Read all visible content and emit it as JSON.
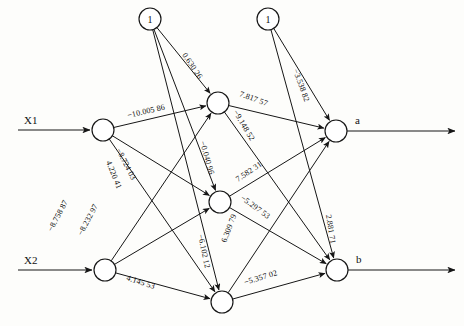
{
  "figure": {
    "type": "neural-network-diagram",
    "canvas": {
      "width": 464,
      "height": 326
    },
    "ink_color": "#161616",
    "background_color": "#fdfdfb"
  },
  "inputs": [
    {
      "id": "x1",
      "label": "X1",
      "node_x": 103,
      "node_y": 130,
      "arrow_from_x": 18,
      "label_x": 24,
      "label_y": 124
    },
    {
      "id": "x2",
      "label": "X2",
      "node_x": 105,
      "node_y": 270,
      "arrow_from_x": 18,
      "label_x": 24,
      "label_y": 264
    }
  ],
  "biases": [
    {
      "id": "bias_hidden",
      "label": "1",
      "node_x": 150,
      "node_y": 19,
      "r": 11
    },
    {
      "id": "bias_output",
      "label": "1",
      "node_x": 268,
      "node_y": 19,
      "r": 11
    }
  ],
  "hidden_nodes": [
    {
      "id": "h1",
      "node_x": 218,
      "node_y": 103,
      "r": 11
    },
    {
      "id": "h2",
      "node_x": 220,
      "node_y": 202,
      "r": 11
    },
    {
      "id": "h3",
      "node_x": 222,
      "node_y": 302,
      "r": 11
    }
  ],
  "output_nodes": [
    {
      "id": "out_a",
      "label": "a",
      "node_x": 336,
      "node_y": 131,
      "r": 11,
      "arrow_to_x": 455,
      "label_x": 355,
      "label_y": 124
    },
    {
      "id": "out_b",
      "label": "b",
      "node_x": 337,
      "node_y": 270,
      "r": 11,
      "arrow_to_x": 455,
      "label_x": 356,
      "label_y": 263
    }
  ],
  "weights": [
    {
      "id": "w_x1_h1",
      "from": "x1",
      "to": "h1",
      "value": "−10.005 86",
      "lx": 128,
      "ly": 118,
      "angle": -13
    },
    {
      "id": "w_x1_h2",
      "from": "x1",
      "to": "h2",
      "value": "−8.724 03",
      "lx": 116,
      "ly": 150,
      "angle": 63
    },
    {
      "id": "w_x1_h3",
      "from": "x1",
      "to": "h3",
      "value": "4.220 41",
      "lx": 106,
      "ly": 162,
      "angle": 68
    },
    {
      "id": "w_x2_h1",
      "from": "x2",
      "to": "h1",
      "value": "−8.758 87",
      "lx": 52,
      "ly": 232,
      "angle": -62
    },
    {
      "id": "w_x2_h2",
      "from": "x2",
      "to": "h2",
      "value": "−8.232 97",
      "lx": 82,
      "ly": 236,
      "angle": -62
    },
    {
      "id": "w_x2_h3",
      "from": "x2",
      "to": "h3",
      "value": "4.145 53",
      "lx": 126,
      "ly": 280,
      "angle": 18
    },
    {
      "id": "w_b_h1",
      "from": "bias_hidden",
      "to": "h1",
      "value": "0.630 26",
      "lx": 182,
      "ly": 55,
      "angle": 56
    },
    {
      "id": "w_b_h2",
      "from": "bias_hidden",
      "to": "h2",
      "value": "−0.040 96",
      "lx": 200,
      "ly": 142,
      "angle": 74
    },
    {
      "id": "w_b_h3",
      "from": "bias_hidden",
      "to": "h3",
      "value": "−6.102 12",
      "lx": 198,
      "ly": 235,
      "angle": 78
    },
    {
      "id": "w_h1_a",
      "from": "h1",
      "to": "out_a",
      "value": "7.817 57",
      "lx": 239,
      "ly": 96,
      "angle": 20
    },
    {
      "id": "w_h1_b",
      "from": "h1",
      "to": "out_b",
      "value": "−9.148 52",
      "lx": 233,
      "ly": 112,
      "angle": 59
    },
    {
      "id": "w_h2_a",
      "from": "h2",
      "to": "out_a",
      "value": "7.582 31",
      "lx": 238,
      "ly": 182,
      "angle": -34
    },
    {
      "id": "w_h2_b",
      "from": "h2",
      "to": "out_b",
      "value": "−5.297 53",
      "lx": 240,
      "ly": 199,
      "angle": 36
    },
    {
      "id": "w_h3_a",
      "from": "h3",
      "to": "out_a",
      "value": "6.309 79",
      "lx": 226,
      "ly": 243,
      "angle": -69
    },
    {
      "id": "w_h3_b",
      "from": "h3",
      "to": "out_b",
      "value": "−5.357 02",
      "lx": 245,
      "ly": 285,
      "angle": -17
    },
    {
      "id": "w_bo_a",
      "from": "bias_output",
      "to": "out_a",
      "value": "−3.538 82",
      "lx": 293,
      "ly": 70,
      "angle": 70
    },
    {
      "id": "w_bo_b",
      "from": "bias_output",
      "to": "out_b",
      "value": "2.881 71",
      "lx": 326,
      "ly": 215,
      "angle": 81
    }
  ]
}
